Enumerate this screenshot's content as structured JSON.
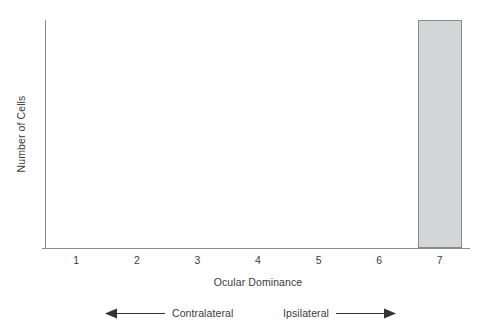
{
  "chart_data": {
    "type": "bar",
    "title": "",
    "subtitle": "",
    "xlabel": "Ocular Dominance",
    "ylabel": "Number of Cells",
    "categories": [
      "1",
      "2",
      "3",
      "4",
      "5",
      "6",
      "7"
    ],
    "values": [
      0,
      0,
      0,
      0,
      0,
      0,
      100
    ],
    "ylim": [
      0,
      100
    ],
    "yticks": [],
    "ytick_labels": [],
    "grid": false,
    "legend": null,
    "bar_fill_color": "#d3d6d6",
    "bar_border_color": "#8a8a8a",
    "axis_color": "#8c8c8c",
    "text_color": "#3b3b3b",
    "annotations": [
      {
        "label": "Contralateral",
        "direction": "left"
      },
      {
        "label": "Ipsilateral",
        "direction": "right"
      }
    ]
  },
  "axes": {
    "y_title": "Number of Cells",
    "x_title": "Ocular Dominance"
  },
  "ticks": {
    "x": [
      "1",
      "2",
      "3",
      "4",
      "5",
      "6",
      "7"
    ]
  },
  "annotation": {
    "contralateral_label": "Contralateral",
    "ipsilateral_label": "Ipsilateral"
  }
}
